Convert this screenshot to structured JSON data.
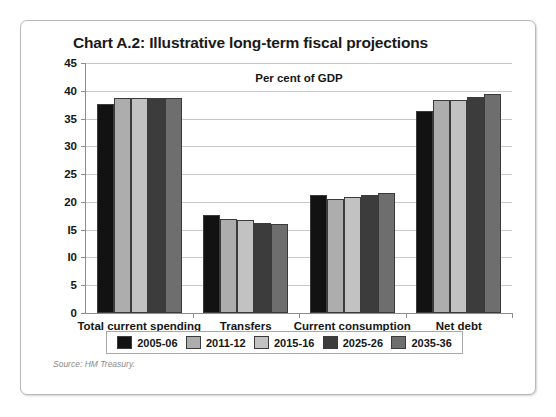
{
  "figure": {
    "title": "Chart A.2: Illustrative long-term fiscal projections",
    "axis_note": "Per cent of GDP",
    "source": "Source: HM Treasury."
  },
  "chart_data": {
    "type": "bar",
    "title": "Chart A.2: Illustrative long-term fiscal projections",
    "subtitle": "Per cent of GDP",
    "xlabel": "",
    "ylabel": "Per cent of GDP",
    "ylim": [
      0,
      45
    ],
    "ytick_step": 5,
    "yticks": [
      0,
      5,
      10,
      15,
      20,
      25,
      30,
      35,
      40,
      45
    ],
    "ytick_labels": [
      "0",
      "5",
      "I0",
      "I5",
      "20",
      "25",
      "30",
      "35",
      "40",
      "45"
    ],
    "grid": true,
    "legend_position": "bottom",
    "categories": [
      "Total current spending",
      "Transfers",
      "Current consumption",
      "Net debt"
    ],
    "series": [
      {
        "name": "2005-06",
        "color": "#121212",
        "values": [
          37.6,
          17.6,
          21.2,
          36.4
        ]
      },
      {
        "name": "2011-12",
        "color": "#adadad",
        "values": [
          38.7,
          17.0,
          20.6,
          38.3
        ]
      },
      {
        "name": "2015-16",
        "color": "#c2c2c2",
        "values": [
          38.7,
          16.8,
          20.8,
          38.3
        ]
      },
      {
        "name": "2025-26",
        "color": "#3c3c3c",
        "values": [
          38.7,
          16.2,
          21.2,
          38.8
        ]
      },
      {
        "name": "2035-36",
        "color": "#6e6e6e",
        "values": [
          38.7,
          16.0,
          21.6,
          39.4
        ]
      }
    ],
    "source": "Source: HM Treasury."
  },
  "colors": {
    "frame": "#b9b9b9",
    "axis": "#8d8d8d",
    "grid": "#c9c9c9",
    "text": "#161616",
    "source_text": "#8a8a8a"
  }
}
